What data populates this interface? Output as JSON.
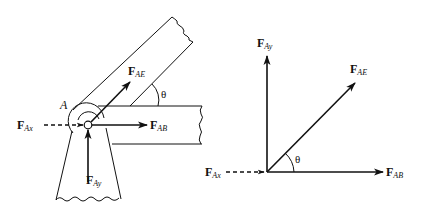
{
  "figure": {
    "left_panel": {
      "description": "Joint A of a truss with members AE (inclined), AB (horizontal) and a support; free body at pin A",
      "point_label": "A",
      "angle_label": "θ",
      "forces": [
        {
          "id": "FAx",
          "main": "F",
          "sub": "Ax",
          "direction": "right",
          "style": "dashed"
        },
        {
          "id": "FAB",
          "main": "F",
          "sub": "AB",
          "direction": "right",
          "style": "solid"
        },
        {
          "id": "FAE",
          "main": "F",
          "sub": "AE",
          "direction": "up-right at θ",
          "style": "solid"
        },
        {
          "id": "FAy",
          "main": "F",
          "sub": "Ay",
          "direction": "up",
          "style": "solid"
        }
      ]
    },
    "right_panel": {
      "description": "Free-body vector diagram at joint A",
      "angle_label": "θ",
      "forces": [
        {
          "id": "FAy",
          "main": "F",
          "sub": "Ay",
          "direction": "up",
          "style": "solid"
        },
        {
          "id": "FAE",
          "main": "F",
          "sub": "AE",
          "direction": "up-right at θ",
          "style": "solid"
        },
        {
          "id": "FAx",
          "main": "F",
          "sub": "Ax",
          "direction": "right",
          "style": "dashed"
        },
        {
          "id": "FAB",
          "main": "F",
          "sub": "AB",
          "direction": "right",
          "style": "solid"
        }
      ]
    },
    "colors": {
      "stroke": "#111111",
      "background": "#ffffff"
    }
  }
}
